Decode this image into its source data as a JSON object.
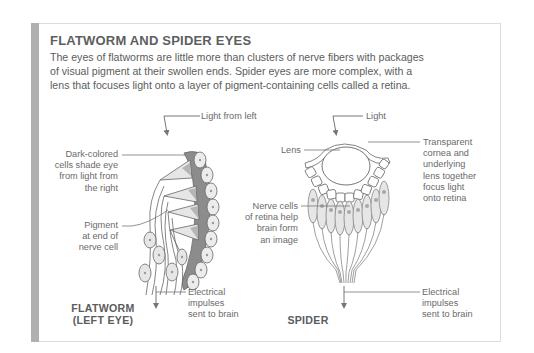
{
  "figure": {
    "title": "FLATWORM AND SPIDER EYES",
    "intro_lines": [
      "The eyes of flatworms are little more than clusters of nerve fibers with packages",
      "of visual pigment at their swollen ends. Spider eyes are more complex, with a",
      "lens that focuses light onto a layer of pigment-containing cells called a retina."
    ],
    "colors": {
      "side_bar": "#b0b0b0",
      "pigment_dark": "#8c8c8c",
      "cell_fill": "#ececec",
      "line": "#6a6a6a",
      "text": "#5c5c5c"
    }
  },
  "flatworm": {
    "name_line1": "FLATWORM",
    "name_line2": "(LEFT EYE)",
    "light_label": "Light from left",
    "dark_cells_lines": [
      "Dark-colored",
      "cells shade eye",
      "from light from",
      "the right"
    ],
    "pigment_lines": [
      "Pigment",
      "at end of",
      "nerve cell"
    ],
    "impulse_lines": [
      "Electrical",
      "impulses",
      "sent to brain"
    ]
  },
  "spider": {
    "name": "SPIDER",
    "light_label": "Light",
    "lens_label": "Lens",
    "cornea_lines": [
      "Transparent",
      "cornea and",
      "underlying",
      "lens together",
      "focus light",
      "onto retina"
    ],
    "retina_lines": [
      "Nerve cells",
      "of retina help",
      "brain form",
      "an image"
    ],
    "impulse_lines": [
      "Electrical",
      "impulses",
      "sent to brain"
    ]
  }
}
